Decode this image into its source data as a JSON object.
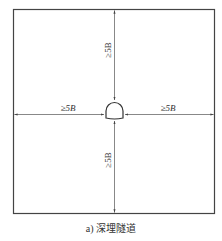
{
  "figure": {
    "caption": "a) 深埋隧道",
    "labels": {
      "top": "≥5B",
      "bottom": "≥5B",
      "left": "≥5B",
      "right": "≥5B"
    },
    "colors": {
      "line": "#555555",
      "frame": "#444444",
      "text": "#333333"
    }
  }
}
